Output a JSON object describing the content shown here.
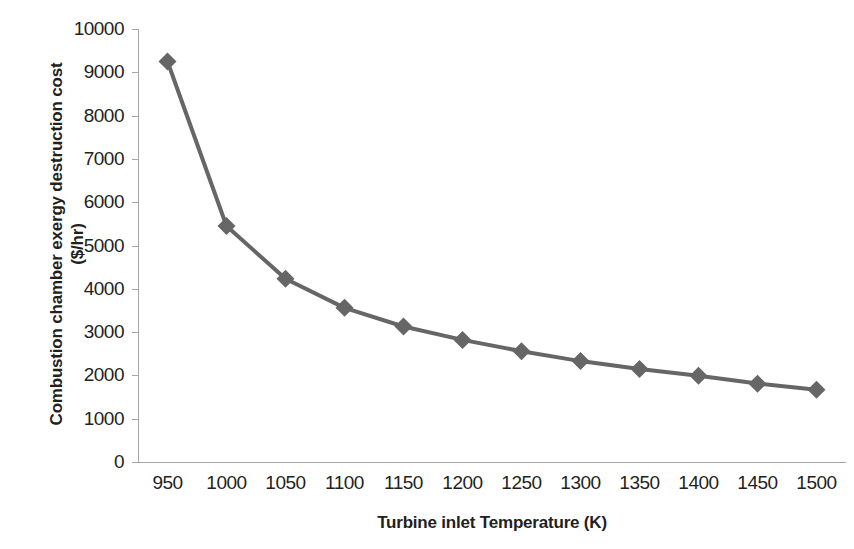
{
  "chart_data": {
    "type": "line",
    "title": "",
    "xlabel": "Turbine inlet Temperature (K)",
    "ylabel": "Combustion chamber exergy destruction cost ($/hr)",
    "ylabel_line1": "Combustion chamber exergy destruction cost",
    "ylabel_line2": "($/hr)",
    "categories": [
      950,
      1000,
      1050,
      1100,
      1150,
      1200,
      1250,
      1300,
      1350,
      1400,
      1450,
      1500
    ],
    "x_tick_labels": [
      "950",
      "1000",
      "1050",
      "1100",
      "1150",
      "1200",
      "1250",
      "1300",
      "1350",
      "1400",
      "1450",
      "1500"
    ],
    "values": [
      9250,
      5450,
      4230,
      3560,
      3130,
      2820,
      2560,
      2330,
      2150,
      1990,
      1810,
      1670
    ],
    "y_tick_labels": [
      "10000",
      "9000",
      "8000",
      "7000",
      "6000",
      "5000",
      "4000",
      "3000",
      "2000",
      "1000",
      "0"
    ],
    "y_ticks": [
      10000,
      9000,
      8000,
      7000,
      6000,
      5000,
      4000,
      3000,
      2000,
      1000,
      0
    ],
    "ylim": [
      0,
      10000
    ],
    "xlim": [
      950,
      1500
    ],
    "grid": false,
    "legend": null,
    "series_color": "#666666",
    "axis_color": "#a6a6a6",
    "text_color": "#231f20",
    "marker": "diamond",
    "marker_size": 9,
    "line_width": 4
  }
}
